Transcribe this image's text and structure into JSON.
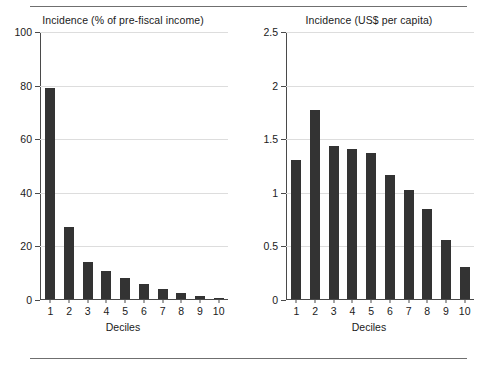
{
  "figure": {
    "background_color": "#ffffff",
    "bar_color": "#333333",
    "axis_color": "#4a4a4a",
    "grid_color": "#dddddd",
    "rule_color": "#6f6f6f"
  },
  "chart_data": [
    {
      "type": "bar",
      "title": "Incidence (% of pre-fiscal income)",
      "xlabel": "Deciles",
      "ylabel": "",
      "categories": [
        "1",
        "2",
        "3",
        "4",
        "5",
        "6",
        "7",
        "8",
        "9",
        "10"
      ],
      "values": [
        79,
        27,
        14,
        10.4,
        8,
        5.5,
        3.8,
        2.3,
        1.2,
        0.3
      ],
      "ylim": [
        0,
        100
      ],
      "yticks": [
        0,
        20,
        40,
        60,
        80,
        100
      ],
      "ytick_labels": [
        "0",
        "20",
        "40",
        "60",
        "80",
        "100"
      ],
      "grid": true,
      "legend": "none"
    },
    {
      "type": "bar",
      "title": "Incidence (US$ per capita)",
      "xlabel": "Deciles",
      "ylabel": "",
      "categories": [
        "1",
        "2",
        "3",
        "4",
        "5",
        "6",
        "7",
        "8",
        "9",
        "10"
      ],
      "values": [
        1.3,
        1.77,
        1.43,
        1.4,
        1.37,
        1.16,
        1.02,
        0.84,
        0.55,
        0.3
      ],
      "ylim": [
        0,
        2.5
      ],
      "yticks": [
        0,
        0.5,
        1,
        1.5,
        2,
        2.5
      ],
      "ytick_labels": [
        "0",
        "0.5",
        "1",
        "1.5",
        "2",
        "2.5"
      ],
      "grid": true,
      "legend": "none"
    }
  ]
}
